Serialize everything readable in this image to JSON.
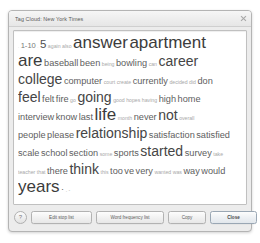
{
  "window": {
    "title": "Tag Cloud: New York Times",
    "close_icon": "close-x-icon"
  },
  "cloud": {
    "lines": [
      [
        {
          "text": ".",
          "size": 2
        },
        {
          "text": "1-10",
          "size": 5
        },
        {
          "text": ".",
          "size": 2
        },
        {
          "text": "5",
          "size": 7
        },
        {
          "text": "again",
          "size": 3
        },
        {
          "text": "also",
          "size": 3
        },
        {
          "text": "answer",
          "size": 9
        },
        {
          "text": "apartment",
          "size": 9
        }
      ],
      [
        {
          "text": "are",
          "size": 9
        },
        {
          "text": "baseball",
          "size": 6
        },
        {
          "text": "been",
          "size": 6
        },
        {
          "text": "being",
          "size": 3
        },
        {
          "text": "bowling",
          "size": 6
        },
        {
          "text": "can",
          "size": 3
        },
        {
          "text": "career",
          "size": 8
        }
      ],
      [
        {
          "text": "college",
          "size": 8
        },
        {
          "text": "computer",
          "size": 6
        },
        {
          "text": "court",
          "size": 3
        },
        {
          "text": "create",
          "size": 3
        },
        {
          "text": "currently",
          "size": 6
        },
        {
          "text": "decided",
          "size": 3
        },
        {
          "text": "did",
          "size": 3
        },
        {
          "text": "don",
          "size": 6
        }
      ],
      [
        {
          "text": "feel",
          "size": 8
        },
        {
          "text": "felt",
          "size": 6
        },
        {
          "text": "fire",
          "size": 6
        },
        {
          "text": "go",
          "size": 3
        },
        {
          "text": "going",
          "size": 8
        },
        {
          "text": "good",
          "size": 3
        },
        {
          "text": "hopes",
          "size": 3
        },
        {
          "text": "having",
          "size": 3
        },
        {
          "text": "high",
          "size": 6
        },
        {
          "text": "home",
          "size": 6
        }
      ],
      [
        {
          "text": "interview",
          "size": 6
        },
        {
          "text": "know",
          "size": 6
        },
        {
          "text": "last",
          "size": 6
        },
        {
          "text": "life",
          "size": 9
        },
        {
          "text": "month",
          "size": 3
        },
        {
          "text": "never",
          "size": 6
        },
        {
          "text": "not",
          "size": 8
        },
        {
          "text": "overall",
          "size": 3
        }
      ],
      [
        {
          "text": "people",
          "size": 6
        },
        {
          "text": "please",
          "size": 6
        },
        {
          "text": "relationship",
          "size": 8
        },
        {
          "text": "satisfaction",
          "size": 6
        },
        {
          "text": "satisfied",
          "size": 6
        }
      ],
      [
        {
          "text": "scale",
          "size": 6
        },
        {
          "text": "school",
          "size": 6
        },
        {
          "text": "section",
          "size": 6
        },
        {
          "text": "some",
          "size": 3
        },
        {
          "text": "sports",
          "size": 6
        },
        {
          "text": "started",
          "size": 8
        },
        {
          "text": "survey",
          "size": 6
        },
        {
          "text": "take",
          "size": 3
        }
      ],
      [
        {
          "text": "teacher",
          "size": 3
        },
        {
          "text": "that",
          "size": 3
        },
        {
          "text": "there",
          "size": 6
        },
        {
          "text": "think",
          "size": 8
        },
        {
          "text": "this",
          "size": 3
        },
        {
          "text": "too",
          "size": 6
        },
        {
          "text": "ve",
          "size": 6
        },
        {
          "text": "very",
          "size": 6
        },
        {
          "text": "wanted",
          "size": 3
        },
        {
          "text": "was",
          "size": 3
        },
        {
          "text": "way",
          "size": 6
        },
        {
          "text": "would",
          "size": 6
        }
      ],
      [
        {
          "text": "years",
          "size": 9
        },
        {
          "text": "·",
          "size": 6
        },
        {
          "text": ".",
          "size": 3
        },
        {
          "text": "-",
          "size": 3
        }
      ]
    ]
  },
  "buttons": {
    "help": "?",
    "edit_stop_list": "Edit stop list",
    "word_frequency_list": "Word frequency list",
    "copy": "Copy",
    "close": "Close"
  }
}
